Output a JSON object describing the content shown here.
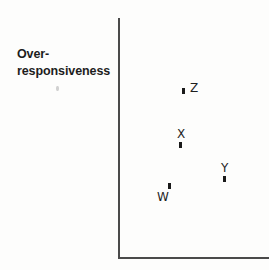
{
  "figure": {
    "background_color": "#fdfdfc",
    "axis_color": "#4a4a4a",
    "marker_color": "#1a1a1a",
    "width": 269,
    "height": 270
  },
  "axis": {
    "y_label_line1": "Over-",
    "y_label_line2": "responsiveness",
    "x_label": "",
    "tick_labels": []
  },
  "chart_data": {
    "type": "scatter",
    "title": "",
    "xlabel": "",
    "ylabel": "Over-responsiveness",
    "grid": false,
    "legend": false,
    "axis_ticks": false,
    "xlim": [
      0,
      100
    ],
    "ylim": [
      0,
      100
    ],
    "points": [
      {
        "label": "Z",
        "x": 43,
        "y": 70,
        "label_position": "right",
        "px": 183,
        "py": 90
      },
      {
        "label": "X",
        "x": 41,
        "y": 47,
        "label_position": "above",
        "px": 180,
        "py": 144
      },
      {
        "label": "Y",
        "x": 70,
        "y": 33,
        "label_position": "above",
        "px": 224,
        "py": 178
      },
      {
        "label": "W",
        "x": 34,
        "y": 30,
        "label_position": "left",
        "px": 169,
        "py": 185
      }
    ]
  }
}
